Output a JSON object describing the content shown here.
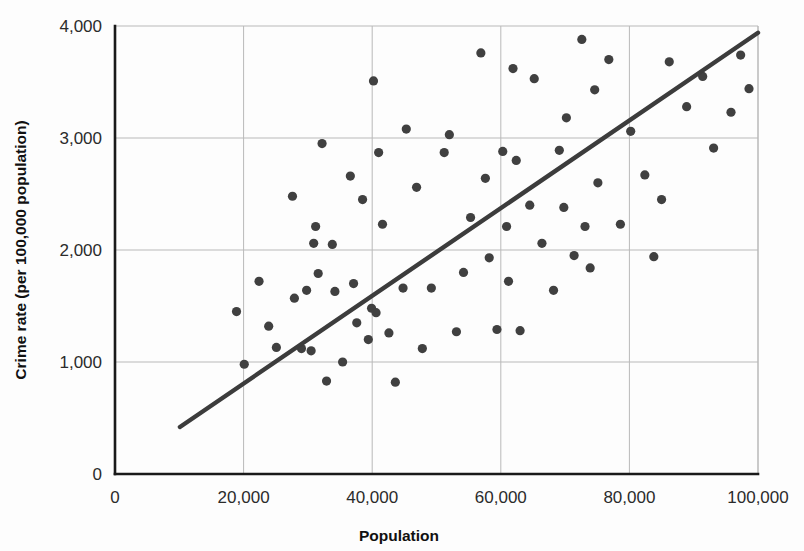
{
  "chart_data": {
    "type": "scatter",
    "title": "",
    "xlabel": "Population",
    "ylabel": "Crime rate (per 100,000 population)",
    "xlim": [
      0,
      100000
    ],
    "ylim": [
      0,
      4000
    ],
    "grid": true,
    "legend": "none",
    "x_ticks": [
      0,
      20000,
      40000,
      60000,
      80000,
      100000
    ],
    "x_tick_labels": [
      "0",
      "20,000",
      "40,000",
      "60,000",
      "80,000",
      "100,000"
    ],
    "y_ticks": [
      0,
      1000,
      2000,
      3000,
      4000
    ],
    "y_tick_labels": [
      "0",
      "1,000",
      "2,000",
      "3,000",
      "4,000"
    ],
    "point_color": "#404040",
    "line_color": "#3c3c3c",
    "grid_color": "#b9b9b9",
    "axis_color": "#1a1a1a",
    "marker_radius": 4.6,
    "trend_line": {
      "label": "regression line",
      "x_start": 10100,
      "y_start": 420,
      "x_end": 100000,
      "y_end": 3940
    },
    "points": [
      {
        "x": 18900,
        "y": 1450
      },
      {
        "x": 20100,
        "y": 980
      },
      {
        "x": 22400,
        "y": 1720
      },
      {
        "x": 23900,
        "y": 1320
      },
      {
        "x": 25100,
        "y": 1130
      },
      {
        "x": 27600,
        "y": 2480
      },
      {
        "x": 27900,
        "y": 1570
      },
      {
        "x": 29000,
        "y": 1120
      },
      {
        "x": 29800,
        "y": 1640
      },
      {
        "x": 30500,
        "y": 1100
      },
      {
        "x": 30900,
        "y": 2060
      },
      {
        "x": 31200,
        "y": 2210
      },
      {
        "x": 31600,
        "y": 1790
      },
      {
        "x": 32200,
        "y": 2950
      },
      {
        "x": 32900,
        "y": 830
      },
      {
        "x": 33800,
        "y": 2050
      },
      {
        "x": 34200,
        "y": 1630
      },
      {
        "x": 35400,
        "y": 1000
      },
      {
        "x": 36600,
        "y": 2660
      },
      {
        "x": 37100,
        "y": 1700
      },
      {
        "x": 37600,
        "y": 1350
      },
      {
        "x": 38500,
        "y": 2450
      },
      {
        "x": 39400,
        "y": 1200
      },
      {
        "x": 39900,
        "y": 1480
      },
      {
        "x": 40200,
        "y": 3510
      },
      {
        "x": 40600,
        "y": 1440
      },
      {
        "x": 41000,
        "y": 2870
      },
      {
        "x": 41600,
        "y": 2230
      },
      {
        "x": 42600,
        "y": 1260
      },
      {
        "x": 43600,
        "y": 820
      },
      {
        "x": 44800,
        "y": 1660
      },
      {
        "x": 45300,
        "y": 3080
      },
      {
        "x": 46900,
        "y": 2560
      },
      {
        "x": 47800,
        "y": 1120
      },
      {
        "x": 49200,
        "y": 1660
      },
      {
        "x": 51200,
        "y": 2870
      },
      {
        "x": 52000,
        "y": 3030
      },
      {
        "x": 53100,
        "y": 1270
      },
      {
        "x": 54200,
        "y": 1800
      },
      {
        "x": 55300,
        "y": 2290
      },
      {
        "x": 56900,
        "y": 3760
      },
      {
        "x": 57600,
        "y": 2640
      },
      {
        "x": 58200,
        "y": 1930
      },
      {
        "x": 59400,
        "y": 1290
      },
      {
        "x": 60300,
        "y": 2880
      },
      {
        "x": 60900,
        "y": 2210
      },
      {
        "x": 61200,
        "y": 1720
      },
      {
        "x": 61900,
        "y": 3620
      },
      {
        "x": 62400,
        "y": 2800
      },
      {
        "x": 63000,
        "y": 1280
      },
      {
        "x": 64500,
        "y": 2400
      },
      {
        "x": 65200,
        "y": 3530
      },
      {
        "x": 66400,
        "y": 2060
      },
      {
        "x": 68200,
        "y": 1640
      },
      {
        "x": 69100,
        "y": 2890
      },
      {
        "x": 69800,
        "y": 2380
      },
      {
        "x": 70200,
        "y": 3180
      },
      {
        "x": 71400,
        "y": 1950
      },
      {
        "x": 72600,
        "y": 3880
      },
      {
        "x": 73100,
        "y": 2210
      },
      {
        "x": 73900,
        "y": 1840
      },
      {
        "x": 74600,
        "y": 3430
      },
      {
        "x": 75100,
        "y": 2600
      },
      {
        "x": 76800,
        "y": 3700
      },
      {
        "x": 78600,
        "y": 2230
      },
      {
        "x": 80200,
        "y": 3060
      },
      {
        "x": 82400,
        "y": 2670
      },
      {
        "x": 83800,
        "y": 1940
      },
      {
        "x": 85000,
        "y": 2450
      },
      {
        "x": 86200,
        "y": 3680
      },
      {
        "x": 88900,
        "y": 3280
      },
      {
        "x": 91400,
        "y": 3550
      },
      {
        "x": 93100,
        "y": 2910
      },
      {
        "x": 95800,
        "y": 3230
      },
      {
        "x": 97300,
        "y": 3740
      },
      {
        "x": 98600,
        "y": 3440
      }
    ]
  }
}
